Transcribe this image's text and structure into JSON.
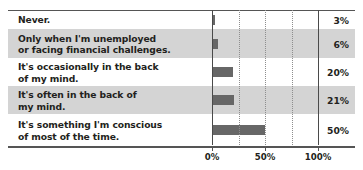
{
  "chart_data": {
    "type": "bar",
    "orientation": "horizontal",
    "title": "",
    "xlabel": "",
    "ylabel": "",
    "xlim": [
      0,
      100
    ],
    "grid": true,
    "legend": false,
    "categories": [
      "Never.",
      "Only when I'm unemployed\nor facing financial challenges.",
      "It's occasionally in the back\nof my mind.",
      "It's often in the back of\nmy mind.",
      "It's something I'm conscious\nof most of the time."
    ],
    "values": [
      3,
      6,
      20,
      21,
      50
    ],
    "value_labels": [
      "3%",
      "6%",
      "20%",
      "21%",
      "50%"
    ],
    "xticks": [
      0,
      50,
      100
    ],
    "xticklabels": [
      "0%",
      "50%",
      "100%"
    ],
    "gridlines": [
      0,
      25,
      50,
      75,
      100
    ]
  },
  "rows": [
    {
      "label": "Never.",
      "value": "3%",
      "pct": 3,
      "shaded": false
    },
    {
      "label": "Only when I'm unemployed\nor facing financial challenges.",
      "value": "6%",
      "pct": 6,
      "shaded": true
    },
    {
      "label": "It's occasionally in the back\nof my mind.",
      "value": "20%",
      "pct": 20,
      "shaded": false
    },
    {
      "label": "It's often in the back of\nmy mind.",
      "value": "21%",
      "pct": 21,
      "shaded": true
    },
    {
      "label": "It's something I'm conscious\nof most of the time.",
      "value": "50%",
      "pct": 50,
      "shaded": false
    }
  ],
  "axis": {
    "ticks": [
      {
        "label": "0%",
        "pct": 0
      },
      {
        "label": "50%",
        "pct": 50
      },
      {
        "label": "100%",
        "pct": 100
      }
    ]
  },
  "colors": {
    "bar": "#676767",
    "row_shaded": "#d4d4d4",
    "row_plain": "#ffffff",
    "text": "#231f20",
    "axis": "#555555",
    "gridline_major": "#4a4a4a",
    "gridline_minor": "#8e8e8e"
  }
}
